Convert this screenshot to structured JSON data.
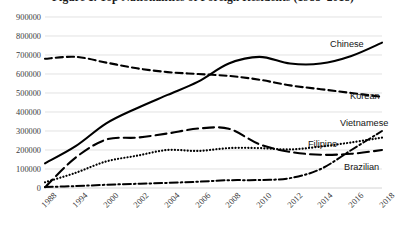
{
  "figure": {
    "title": "Figure 1. Top Nationalities of Foreign Residents (1988–2018)"
  },
  "chart_data": {
    "type": "line",
    "title": "Figure 1. Top Nationalities of Foreign Residents (1988–2018)",
    "xlabel": "",
    "ylabel": "",
    "grid": true,
    "legend_position": "right-inline-labels",
    "ylim": [
      0,
      900000
    ],
    "yticks": [
      0,
      100000,
      200000,
      300000,
      400000,
      500000,
      600000,
      700000,
      800000,
      900000
    ],
    "ytick_labels": [
      "0",
      "100000",
      "200000",
      "300000",
      "400000",
      "500000",
      "600000",
      "700000",
      "800000",
      "900000"
    ],
    "categories": [
      "1988",
      "1994",
      "2000",
      "2002",
      "2004",
      "2006",
      "2008",
      "2010",
      "2012",
      "2014",
      "2016",
      "2018"
    ],
    "x": [
      1988,
      1994,
      2000,
      2002,
      2004,
      2006,
      2008,
      2010,
      2012,
      2014,
      2016,
      2018
    ],
    "series": [
      {
        "name": "Chinese",
        "label": "Chinese",
        "style": "solid",
        "color": "#000000",
        "values": [
          130000,
          220000,
          340000,
          420000,
          490000,
          560000,
          655000,
          690000,
          655000,
          655000,
          695000,
          765000
        ]
      },
      {
        "name": "Korean",
        "label": "Korean",
        "style": "dashed",
        "color": "#000000",
        "values": [
          680000,
          690000,
          660000,
          630000,
          610000,
          600000,
          590000,
          570000,
          540000,
          520000,
          500000,
          480000
        ]
      },
      {
        "name": "Vietnamese",
        "label": "Vietnamese",
        "style": "dashdot",
        "color": "#000000",
        "values": [
          5000,
          10000,
          17000,
          22000,
          27000,
          33000,
          41000,
          42000,
          52000,
          100000,
          200000,
          300000
        ]
      },
      {
        "name": "Filipino",
        "label": "Filipino",
        "style": "dotted",
        "color": "#000000",
        "values": [
          30000,
          80000,
          140000,
          170000,
          200000,
          195000,
          210000,
          210000,
          203000,
          218000,
          240000,
          265000
        ]
      },
      {
        "name": "Brazilian",
        "label": "Brazilian",
        "style": "longdash",
        "color": "#000000",
        "values": [
          4000,
          160000,
          255000,
          265000,
          287000,
          313000,
          312000,
          230000,
          190000,
          175000,
          180000,
          200000
        ]
      }
    ]
  },
  "axes": {
    "y_labels": [
      "900000",
      "800000",
      "700000",
      "600000",
      "500000",
      "400000",
      "300000",
      "200000",
      "100000",
      "0"
    ],
    "x_labels": [
      "1988",
      "1994",
      "2000",
      "2002",
      "2004",
      "2006",
      "2008",
      "2010",
      "2012",
      "2014",
      "2016",
      "2018"
    ]
  },
  "series_labels": {
    "chinese": "Chinese",
    "korean": "Korean",
    "vietnamese": "Vietnamese",
    "filipino": "Filipino",
    "brazilian": "Brazilian"
  }
}
